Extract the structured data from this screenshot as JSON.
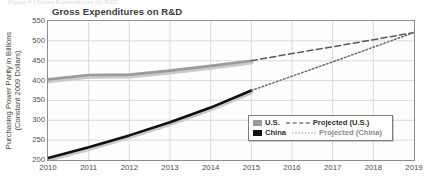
{
  "top_caption_faint": "Figure 4 | Gross Expenditures on R&D",
  "chart_data": {
    "type": "line",
    "title": "Gross Expenditures on R&D",
    "xlabel": "",
    "ylabel": "Purchasing Power Parity in Billions\n(Constant 2009 Dollars)",
    "x": [
      2010,
      2011,
      2012,
      2013,
      2014,
      2015,
      2016,
      2017,
      2018,
      2019
    ],
    "xlim": [
      2010,
      2019
    ],
    "ylim": [
      200,
      550
    ],
    "yticks": [
      200,
      250,
      300,
      350,
      400,
      450,
      500,
      550
    ],
    "xticks": [
      "2010",
      "2011",
      "2012",
      "2013",
      "2014",
      "2015",
      "2016",
      "2017",
      "2018",
      "2019"
    ],
    "grid": true,
    "legend_position": "inside-bottom-right",
    "series": [
      {
        "name": "U.S.",
        "style": "solid",
        "color": "#9a9a9a",
        "x": [
          2010,
          2011,
          2012,
          2013,
          2014,
          2015
        ],
        "values": [
          403,
          414,
          415,
          425,
          437,
          450
        ]
      },
      {
        "name": "China",
        "style": "solid",
        "color": "#101010",
        "x": [
          2010,
          2011,
          2012,
          2013,
          2014,
          2015
        ],
        "values": [
          205,
          232,
          262,
          295,
          332,
          375
        ]
      },
      {
        "name": "Projected (U.S.)",
        "style": "dashed",
        "color": "#5a5a5a",
        "x": [
          2015,
          2016,
          2017,
          2018,
          2019
        ],
        "values": [
          450,
          468,
          485,
          503,
          521
        ]
      },
      {
        "name": "Projected (China)",
        "style": "dotted",
        "color": "#6e6e6e",
        "x": [
          2015,
          2016,
          2017,
          2018,
          2019
        ],
        "values": [
          375,
          411,
          447,
          484,
          521
        ]
      }
    ]
  },
  "legend": {
    "rows": [
      {
        "solid_label": "U.S.",
        "dash_label": "Projected (U.S.)"
      },
      {
        "solid_label": "China",
        "dash_label": "Projected (China)"
      }
    ]
  }
}
